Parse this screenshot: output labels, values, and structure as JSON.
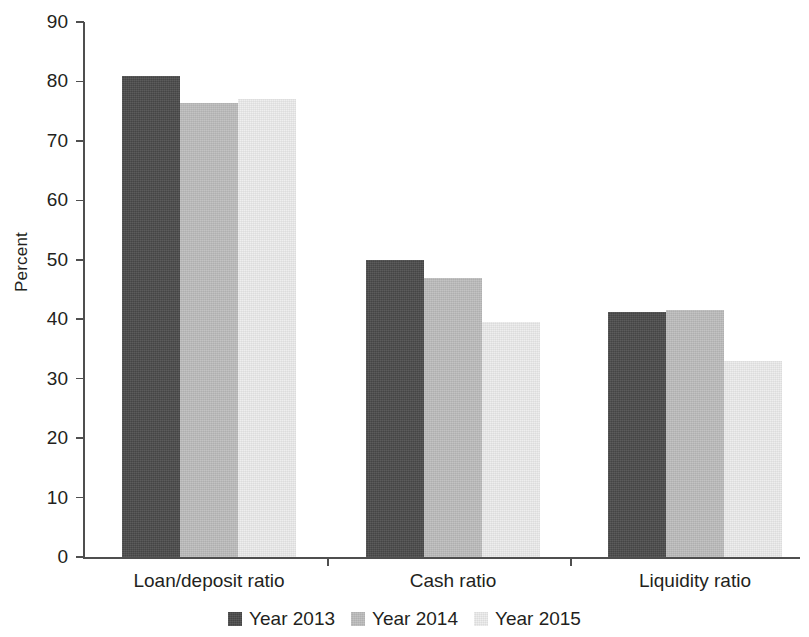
{
  "chart_data": {
    "type": "bar",
    "title": "",
    "subtitle": "",
    "xlabel": "",
    "ylabel": "Percent",
    "categories": [
      "Loan/deposit ratio",
      "Cash ratio",
      "Liquidity ratio"
    ],
    "series": [
      {
        "name": "Year 2013",
        "color": "#4a4a4a",
        "values": [
          81.0,
          50.0,
          41.3
        ]
      },
      {
        "name": "Year 2014",
        "color": "#bdbdbd",
        "values": [
          76.3,
          47.0,
          41.6
        ]
      },
      {
        "name": "Year 2015",
        "color": "#ededed",
        "values": [
          77.0,
          39.5,
          33.0
        ]
      }
    ],
    "ylim": [
      0,
      90
    ],
    "ytick_values": [
      0,
      10,
      20,
      30,
      40,
      50,
      60,
      70,
      80,
      90
    ],
    "ytick_labels": [
      "0",
      "10",
      "20",
      "30",
      "40",
      "50",
      "60",
      "70",
      "80",
      "90"
    ],
    "grid": false,
    "legend_position": "bottom-center",
    "legend_entries": [
      "Year 2013",
      "Year 2014",
      "Year 2015"
    ],
    "annotations": []
  },
  "axes": {
    "y_title": "Percent"
  },
  "legend": {
    "items": [
      {
        "label": "Year 2013"
      },
      {
        "label": "Year 2014"
      },
      {
        "label": "Year 2015"
      }
    ]
  }
}
